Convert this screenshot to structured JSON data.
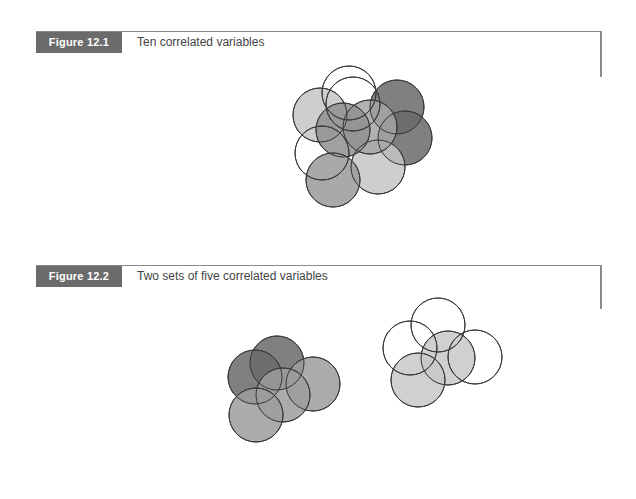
{
  "figures": [
    {
      "label": "Figure 12.1",
      "title": "Ten correlated variables",
      "label_bg": "#6b6b6b",
      "circles": [
        {
          "cx": 320,
          "cy": 115,
          "r": 27,
          "fill": "#c6c6c6"
        },
        {
          "cx": 397,
          "cy": 107,
          "r": 27,
          "fill": "#6a6a6a"
        },
        {
          "cx": 405,
          "cy": 138,
          "r": 27,
          "fill": "#6a6a6a"
        },
        {
          "cx": 378,
          "cy": 167,
          "r": 27,
          "fill": "#c6c6c6"
        },
        {
          "cx": 370,
          "cy": 127,
          "r": 27,
          "fill": "#a4a4a4"
        },
        {
          "cx": 343,
          "cy": 130,
          "r": 27,
          "fill": "#8f8f8f"
        },
        {
          "cx": 333,
          "cy": 180,
          "r": 27,
          "fill": "#9a9a9a"
        },
        {
          "cx": 322,
          "cy": 153,
          "r": 27,
          "fill": "none"
        },
        {
          "cx": 349,
          "cy": 93,
          "r": 27,
          "fill": "none"
        },
        {
          "cx": 353,
          "cy": 104,
          "r": 27,
          "fill": "none"
        }
      ]
    },
    {
      "label": "Figure 12.2",
      "title": "Two sets of five correlated variables",
      "label_bg": "#6b6b6b",
      "circles": [
        {
          "cx": 277,
          "cy": 363,
          "r": 27,
          "fill": "#6a6a6a"
        },
        {
          "cx": 255,
          "cy": 377,
          "r": 27,
          "fill": "#6a6a6a"
        },
        {
          "cx": 313,
          "cy": 384,
          "r": 27,
          "fill": "#9c9c9c"
        },
        {
          "cx": 283,
          "cy": 395,
          "r": 27,
          "fill": "#9c9c9c"
        },
        {
          "cx": 256,
          "cy": 415,
          "r": 27,
          "fill": "#9c9c9c"
        },
        {
          "cx": 448,
          "cy": 358,
          "r": 27,
          "fill": "#c8c8c8"
        },
        {
          "cx": 418,
          "cy": 380,
          "r": 27,
          "fill": "#c8c8c8"
        },
        {
          "cx": 410,
          "cy": 348,
          "r": 27,
          "fill": "none"
        },
        {
          "cx": 438,
          "cy": 325,
          "r": 27,
          "fill": "none"
        },
        {
          "cx": 475,
          "cy": 357,
          "r": 27,
          "fill": "none"
        }
      ]
    }
  ]
}
